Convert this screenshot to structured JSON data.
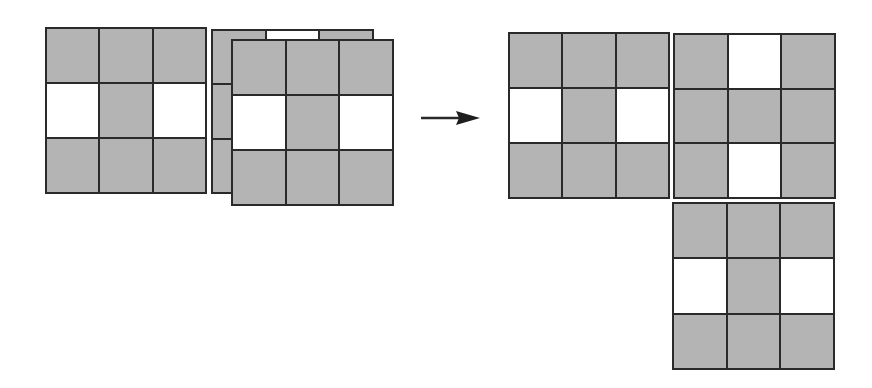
{
  "diagram": {
    "colors": {
      "filled": "#b4b4b4",
      "empty": "#ffffff",
      "line": "#2a2a2a"
    },
    "left": {
      "grid_single": {
        "pattern": [
          [
            1,
            1,
            1
          ],
          [
            0,
            1,
            0
          ],
          [
            1,
            1,
            1
          ]
        ]
      },
      "grid_stack_back": {
        "pattern": [
          [
            1,
            0,
            1
          ],
          [
            1,
            1,
            1
          ],
          [
            1,
            0,
            1
          ]
        ]
      },
      "grid_stack_front": {
        "pattern": [
          [
            1,
            1,
            1
          ],
          [
            0,
            1,
            0
          ],
          [
            1,
            1,
            1
          ]
        ]
      }
    },
    "arrow": {
      "direction": "right"
    },
    "right": {
      "grid_a": {
        "pattern": [
          [
            1,
            1,
            1
          ],
          [
            0,
            1,
            0
          ],
          [
            1,
            1,
            1
          ]
        ]
      },
      "grid_b": {
        "pattern": [
          [
            1,
            0,
            1
          ],
          [
            1,
            1,
            1
          ],
          [
            1,
            0,
            1
          ]
        ]
      },
      "grid_c": {
        "pattern": [
          [
            1,
            1,
            1
          ],
          [
            0,
            1,
            0
          ],
          [
            1,
            1,
            1
          ]
        ]
      }
    }
  }
}
